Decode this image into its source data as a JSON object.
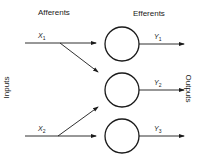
{
  "diagram": {
    "headers": {
      "afferents": "Afferents",
      "efferents": "Efferents"
    },
    "side_labels": {
      "inputs": "Inputs",
      "outputs": "Outputs"
    },
    "inputs": [
      {
        "symbol": "X",
        "sub": "1"
      },
      {
        "symbol": "X",
        "sub": "2"
      }
    ],
    "outputs": [
      {
        "symbol": "Y",
        "sub": "1"
      },
      {
        "symbol": "Y",
        "sub": "2"
      },
      {
        "symbol": "Y",
        "sub": "3"
      }
    ],
    "nodes": 3,
    "colors": {
      "stroke": "#1a1a1a",
      "background": "#ffffff"
    }
  }
}
